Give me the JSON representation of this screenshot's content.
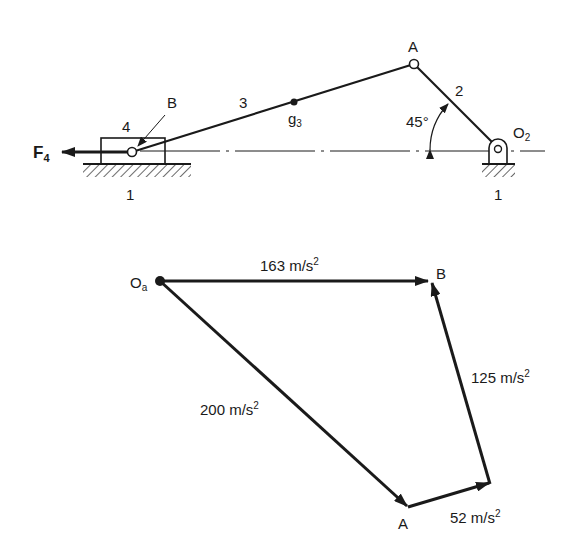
{
  "mechanism": {
    "labels": {
      "force": "F",
      "force_sub": "4",
      "slider_link": "4",
      "point_b": "B",
      "coupler_link": "3",
      "center_g": "g",
      "center_g_sub": "3",
      "point_a": "A",
      "crank_link": "2",
      "angle": "45°",
      "pivot": "O",
      "pivot_sub": "2",
      "ground_left": "1",
      "ground_right": "1"
    }
  },
  "acceleration_polygon": {
    "labels": {
      "origin": "O",
      "origin_sub": "a",
      "point_b": "B",
      "point_a": "A",
      "vec_ob_value": "163 m/s",
      "vec_oa_value": "200 m/s",
      "vec_ab_normal_value": "52 m/s",
      "vec_ab_tangent_value": "125 m/s",
      "exp": "2"
    }
  }
}
